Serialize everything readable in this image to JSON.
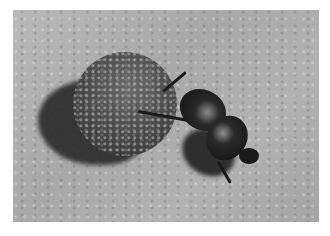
{
  "image": {
    "subject": "dung beetle pushing a dung ball",
    "style": "grayscale photograph",
    "colors": {
      "border": "#ffffff",
      "ground": "#b0b0b0",
      "ball": "#4a4a4a",
      "beetle": "#151515",
      "shadow": "#2a2a2a"
    }
  }
}
